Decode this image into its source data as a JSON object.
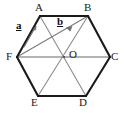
{
  "figure": {
    "shape": "regular-hexagon",
    "colors": {
      "background": "#ffffff",
      "outline": "#1a1a1a",
      "diagonal": "#8c8c8c",
      "vector": "#6e6e6e",
      "label": "#1a1a1a"
    },
    "vertices": [
      {
        "name": "A",
        "label": "A",
        "x": 40,
        "y": 16
      },
      {
        "name": "B",
        "label": "B",
        "x": 88,
        "y": 16
      },
      {
        "name": "C",
        "label": "C",
        "x": 110,
        "y": 57
      },
      {
        "name": "D",
        "label": "D",
        "x": 86,
        "y": 96
      },
      {
        "name": "E",
        "label": "E",
        "x": 38,
        "y": 96
      },
      {
        "name": "F",
        "label": "F",
        "x": 17,
        "y": 57
      }
    ],
    "centre": {
      "name": "O",
      "label": "O",
      "x": 64,
      "y": 57
    },
    "edges": [
      {
        "from": "A",
        "to": "B"
      },
      {
        "from": "B",
        "to": "C"
      },
      {
        "from": "C",
        "to": "D"
      },
      {
        "from": "D",
        "to": "E"
      },
      {
        "from": "E",
        "to": "F"
      },
      {
        "from": "F",
        "to": "A"
      }
    ],
    "diagonals": [
      {
        "from": "F",
        "to": "C"
      },
      {
        "from": "A",
        "to": "D"
      },
      {
        "from": "B",
        "to": "E"
      },
      {
        "from": "F",
        "to": "B"
      }
    ],
    "vectors": [
      {
        "name": "a",
        "label": "a",
        "from": "F",
        "to": "A",
        "description": "vector a drawn parallel to edge FA",
        "x1": 24,
        "y1": 46,
        "x2": 37,
        "y2": 25
      },
      {
        "name": "b",
        "label": "b",
        "from": "F",
        "to": "B",
        "description": "vector b drawn along diagonal FB",
        "x1": 19,
        "y1": 56,
        "x2": 86,
        "y2": 18
      }
    ],
    "labels": {
      "A": "A",
      "B": "B",
      "C": "C",
      "D": "D",
      "E": "E",
      "F": "F",
      "O": "O",
      "a": "a",
      "b": "b"
    }
  }
}
